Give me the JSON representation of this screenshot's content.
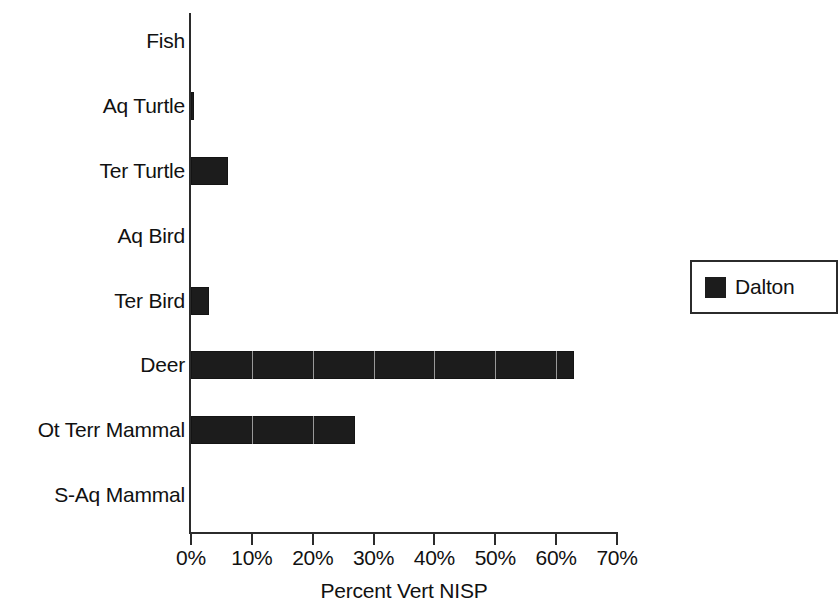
{
  "chart_data": {
    "type": "bar",
    "orientation": "horizontal",
    "title": "",
    "xlabel": "Percent Vert NISP",
    "ylabel": "",
    "xlim": [
      0,
      70
    ],
    "xtick_labels": [
      "0%",
      "10%",
      "20%",
      "30%",
      "40%",
      "50%",
      "60%",
      "70%"
    ],
    "xtick_values": [
      0,
      10,
      20,
      30,
      40,
      50,
      60,
      70
    ],
    "grid": false,
    "legend_position": "right",
    "categories": [
      "Fish",
      "Aq Turtle",
      "Ter Turtle",
      "Aq Bird",
      "Ter Bird",
      "Deer",
      "Ot Terr Mammal",
      "S-Aq Mammal"
    ],
    "series": [
      {
        "name": "Dalton",
        "color": "#1c1c1c",
        "values": [
          0,
          0.5,
          6,
          0,
          3,
          63,
          27,
          0
        ]
      }
    ]
  },
  "legend": {
    "entries": [
      {
        "label": "Dalton",
        "color": "#1c1c1c"
      }
    ]
  }
}
